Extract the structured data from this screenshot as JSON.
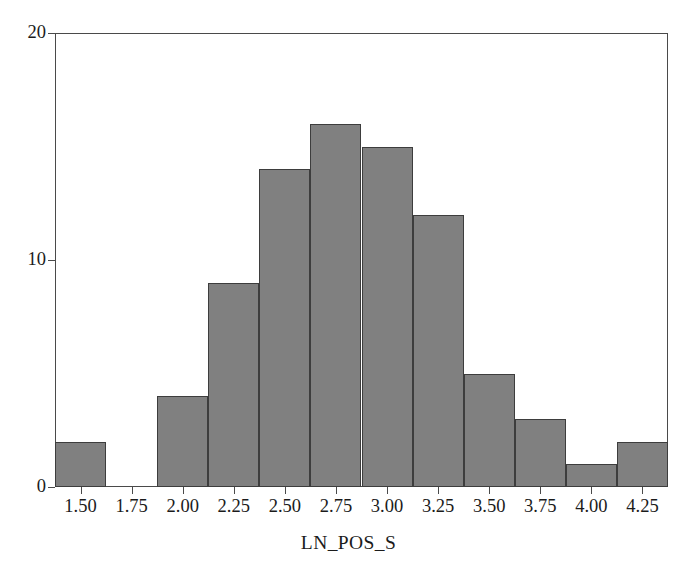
{
  "chart_data": {
    "type": "bar",
    "title": "",
    "subtitle": "",
    "xlabel": "LN_POS_S",
    "ylabel": "",
    "categories": [
      "1.50",
      "1.75",
      "2.00",
      "2.25",
      "2.50",
      "2.75",
      "3.00",
      "3.25",
      "3.50",
      "3.75",
      "4.00",
      "4.25"
    ],
    "values": [
      2,
      0,
      4,
      9,
      14,
      16,
      15,
      12,
      5,
      3,
      1,
      2
    ],
    "bin_width": 0.25,
    "bin_edges": [
      1.375,
      1.625,
      1.875,
      2.125,
      2.375,
      2.625,
      2.875,
      3.125,
      3.375,
      3.625,
      3.875,
      4.125,
      4.375
    ],
    "x_tick_labels": [
      "1.50",
      "1.75",
      "2.00",
      "2.25",
      "2.50",
      "2.75",
      "3.00",
      "3.25",
      "3.50",
      "3.75",
      "4.00",
      "4.25"
    ],
    "x_tick_values": [
      1.5,
      1.75,
      2.0,
      2.25,
      2.5,
      2.75,
      3.0,
      3.25,
      3.5,
      3.75,
      4.0,
      4.25
    ],
    "y_tick_labels": [
      "0",
      "10",
      "20"
    ],
    "y_tick_values": [
      0,
      10,
      20
    ],
    "xlim": [
      1.375,
      4.375
    ],
    "ylim": [
      0,
      20
    ],
    "grid": false,
    "legend": false,
    "bar_color": "#808080",
    "bar_edge_color": "#3d3d3d",
    "axis_color": "#4a4a4a",
    "text_color": "#1b1b1b",
    "background_color": "#ffffff"
  }
}
